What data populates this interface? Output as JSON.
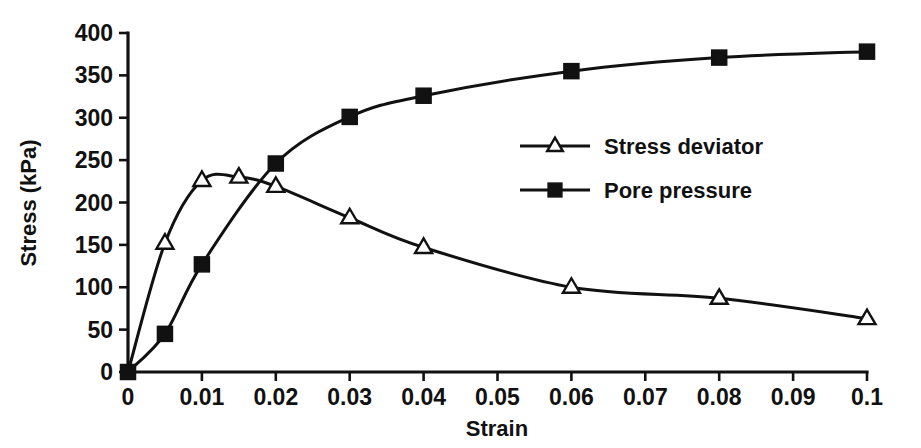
{
  "chart_data": {
    "type": "line",
    "title": "",
    "xlabel": "Strain",
    "ylabel": "Stress (kPa)",
    "xlim": [
      0,
      0.1
    ],
    "ylim": [
      0,
      400
    ],
    "grid": false,
    "legend_position": "center-right",
    "xticks": [
      0,
      0.01,
      0.02,
      0.03,
      0.04,
      0.05,
      0.06,
      0.07,
      0.08,
      0.09,
      0.1
    ],
    "xtick_labels": [
      "0",
      "0.01",
      "0.02",
      "0.03",
      "0.04",
      "0.05",
      "0.06",
      "0.07",
      "0.08",
      "0.09",
      "0.1"
    ],
    "yticks": [
      0,
      50,
      100,
      150,
      200,
      250,
      300,
      350,
      400
    ],
    "ytick_labels": [
      "0",
      "50",
      "100",
      "150",
      "200",
      "250",
      "300",
      "350",
      "400"
    ],
    "series": [
      {
        "name": "Stress deviator",
        "marker": "open-triangle",
        "color": "#111111",
        "x": [
          0,
          0.005,
          0.01,
          0.015,
          0.02,
          0.03,
          0.04,
          0.06,
          0.08,
          0.1
        ],
        "values": [
          0,
          152,
          226,
          230,
          219,
          182,
          147,
          100,
          87,
          63
        ]
      },
      {
        "name": "Pore pressure",
        "marker": "filled-square",
        "color": "#111111",
        "x": [
          0,
          0.005,
          0.01,
          0.02,
          0.03,
          0.04,
          0.06,
          0.08,
          0.1
        ],
        "values": [
          0,
          45,
          127,
          246,
          301,
          326,
          355,
          371,
          378
        ]
      }
    ]
  },
  "legend": {
    "items": [
      {
        "label": "Stress deviator",
        "marker": "open-triangle"
      },
      {
        "label": "Pore pressure",
        "marker": "filled-square"
      }
    ]
  },
  "axes": {
    "x_title": "Strain",
    "y_title": "Stress (kPa)"
  }
}
